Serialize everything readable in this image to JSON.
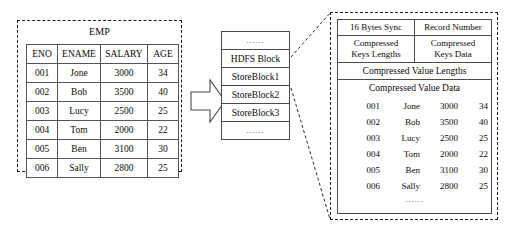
{
  "left_panel": {
    "title": "EMP",
    "columns": [
      "ENO",
      "ENAME",
      "SALARY",
      "AGE"
    ],
    "rows": [
      {
        "eno": "001",
        "ename": "Jone",
        "salary": "3000",
        "age": "34"
      },
      {
        "eno": "002",
        "ename": "Bob",
        "salary": "3500",
        "age": "40"
      },
      {
        "eno": "003",
        "ename": "Lucy",
        "salary": "2500",
        "age": "25"
      },
      {
        "eno": "004",
        "ename": "Tom",
        "salary": "2000",
        "age": "22"
      },
      {
        "eno": "005",
        "ename": "Ben",
        "salary": "3100",
        "age": "30"
      },
      {
        "eno": "006",
        "ename": "Sally",
        "salary": "2800",
        "age": "25"
      }
    ]
  },
  "hdfs_block": {
    "rows": [
      "......",
      "HDFS Block",
      "StoreBlock1",
      "StoreBlock2",
      "StoreBlock3",
      "......"
    ]
  },
  "right_panel": {
    "header_left": "16 Bytes Sync",
    "header_right": "Record Number",
    "keys_lengths": "Compressed\nKeys Lengths",
    "keys_lengths_line1": "Compressed",
    "keys_lengths_line2": "Keys Lengths",
    "keys_data_line1": "Compressed",
    "keys_data_line2": "Keys Data",
    "value_lengths": "Compressed Value Lengths",
    "value_data": "Compressed Value Data",
    "rows": [
      {
        "eno": "001",
        "ename": "Jone",
        "salary": "3000",
        "age": "34"
      },
      {
        "eno": "002",
        "ename": "Bob",
        "salary": "3500",
        "age": "40"
      },
      {
        "eno": "003",
        "ename": "Lucy",
        "salary": "2500",
        "age": "25"
      },
      {
        "eno": "004",
        "ename": "Tom",
        "salary": "2000",
        "age": "22"
      },
      {
        "eno": "005",
        "ename": "Ben",
        "salary": "3100",
        "age": "30"
      },
      {
        "eno": "006",
        "ename": "Sally",
        "salary": "2800",
        "age": "25"
      }
    ],
    "bottom_ellipsis": "......"
  },
  "colors": {
    "line": "#4a4a4a",
    "dashed": "#1a1a1a",
    "text": "#0b0b0b",
    "background": "#ffffff"
  }
}
